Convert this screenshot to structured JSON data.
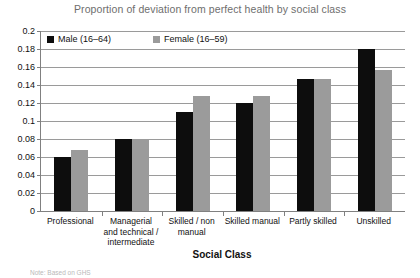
{
  "chart_data": {
    "type": "bar",
    "title": "Proportion of deviation from perfect health by social class",
    "xlabel": "Social Class",
    "ylabel": "",
    "ylim": [
      0,
      0.2
    ],
    "yticks": [
      "0",
      "0.02",
      "0.04",
      "0.06",
      "0.08",
      "0.1",
      "0.12",
      "0.14",
      "0.16",
      "0.18",
      "0.2"
    ],
    "ytick_values": [
      0,
      0.02,
      0.04,
      0.06,
      0.08,
      0.1,
      0.12,
      0.14,
      0.16,
      0.18,
      0.2
    ],
    "grid": true,
    "legend_position": "top-left-inside",
    "categories": [
      "Professional",
      "Managerial and technical / intermediate",
      "Skilled / non manual",
      "Skilled manual",
      "Partly skilled",
      "Unskilled"
    ],
    "category_lines": [
      [
        "Professional"
      ],
      [
        "Managerial",
        "and technical /",
        "intermediate"
      ],
      [
        "Skilled / non",
        "manual"
      ],
      [
        "Skilled manual"
      ],
      [
        "Partly skilled"
      ],
      [
        "Unskilled"
      ]
    ],
    "series": [
      {
        "name": "Male (16–64)",
        "color": "#0d0d0d",
        "values": [
          0.06,
          0.08,
          0.11,
          0.12,
          0.147,
          0.18
        ]
      },
      {
        "name": "Female (16–59)",
        "color": "#9b9b9b",
        "values": [
          0.068,
          0.08,
          0.128,
          0.128,
          0.147,
          0.157
        ]
      }
    ]
  },
  "footnote": {
    "text": "Note: Based on GHS"
  }
}
